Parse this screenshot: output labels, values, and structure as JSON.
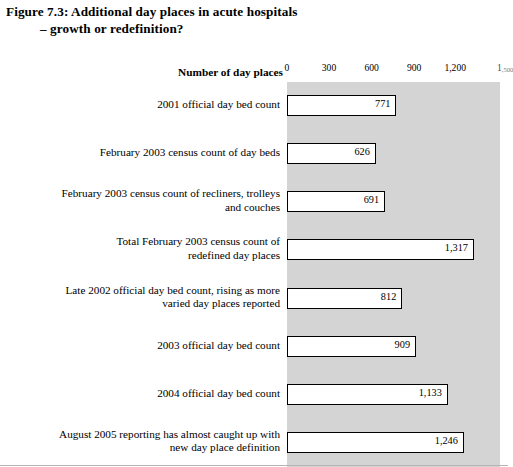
{
  "figure": {
    "title_line_1": "Figure 7.3: Additional day places in acute hospitals",
    "title_line_2": "– growth or redefinition?"
  },
  "chart_data": {
    "type": "bar",
    "orientation": "horizontal",
    "title": "Figure 7.3: Additional day places in acute hospitals – growth or redefinition?",
    "xlabel": "Number of day places",
    "ylabel": "",
    "xlim": [
      0,
      1500
    ],
    "xticks": [
      0,
      300,
      600,
      900,
      1200,
      1500
    ],
    "xtick_labels": [
      "0",
      "300",
      "600",
      "900",
      "1,200",
      "1,500"
    ],
    "grid": false,
    "legend": null,
    "plot_background": "#d4d4d4",
    "bar_fill": "#ffffff",
    "bar_edge": "#000000",
    "categories": [
      "2001 official day bed count",
      "February 2003 census count of day beds",
      "February 2003 census count of recliners, trolleys and couches",
      "Total February 2003 census count of redefined day places",
      "Late 2002 official day bed count, rising as more varied day places reported",
      "2003 official day bed count",
      "2004 official day bed count",
      "August 2005 reporting has almost caught up with new day place definition"
    ],
    "values": [
      771,
      626,
      691,
      1317,
      812,
      909,
      1133,
      1246
    ],
    "value_labels": [
      "771",
      "626",
      "691",
      "1,317",
      "812",
      "909",
      "1,133",
      "1,246"
    ]
  },
  "rows": [
    {
      "label_lines": [
        "2001 official day bed count"
      ],
      "value": 771,
      "value_label": "771"
    },
    {
      "label_lines": [
        "February 2003 census count of day beds"
      ],
      "value": 626,
      "value_label": "626"
    },
    {
      "label_lines": [
        "February 2003 census count of recliners, trolleys",
        "and couches"
      ],
      "value": 691,
      "value_label": "691"
    },
    {
      "label_lines": [
        "Total February 2003 census count of",
        "redefined day places"
      ],
      "value": 1317,
      "value_label": "1,317"
    },
    {
      "label_lines": [
        "Late 2002 official day bed count, rising as more",
        "varied day places reported"
      ],
      "value": 812,
      "value_label": "812"
    },
    {
      "label_lines": [
        "2003 official day bed count"
      ],
      "value": 909,
      "value_label": "909"
    },
    {
      "label_lines": [
        "2004 official day bed count"
      ],
      "value": 1133,
      "value_label": "1,133"
    },
    {
      "label_lines": [
        "August 2005 reporting has almost caught up with",
        "new day place definition"
      ],
      "value": 1246,
      "value_label": "1,246"
    }
  ],
  "axis": {
    "label": "Number of day places",
    "ticks": [
      {
        "label": "0",
        "value": 0
      },
      {
        "label": "300",
        "value": 300
      },
      {
        "label": "600",
        "value": 600
      },
      {
        "label": "900",
        "value": 900
      },
      {
        "label": "1,200",
        "value": 1200
      },
      {
        "label": "1,500",
        "value": 1500
      }
    ]
  }
}
